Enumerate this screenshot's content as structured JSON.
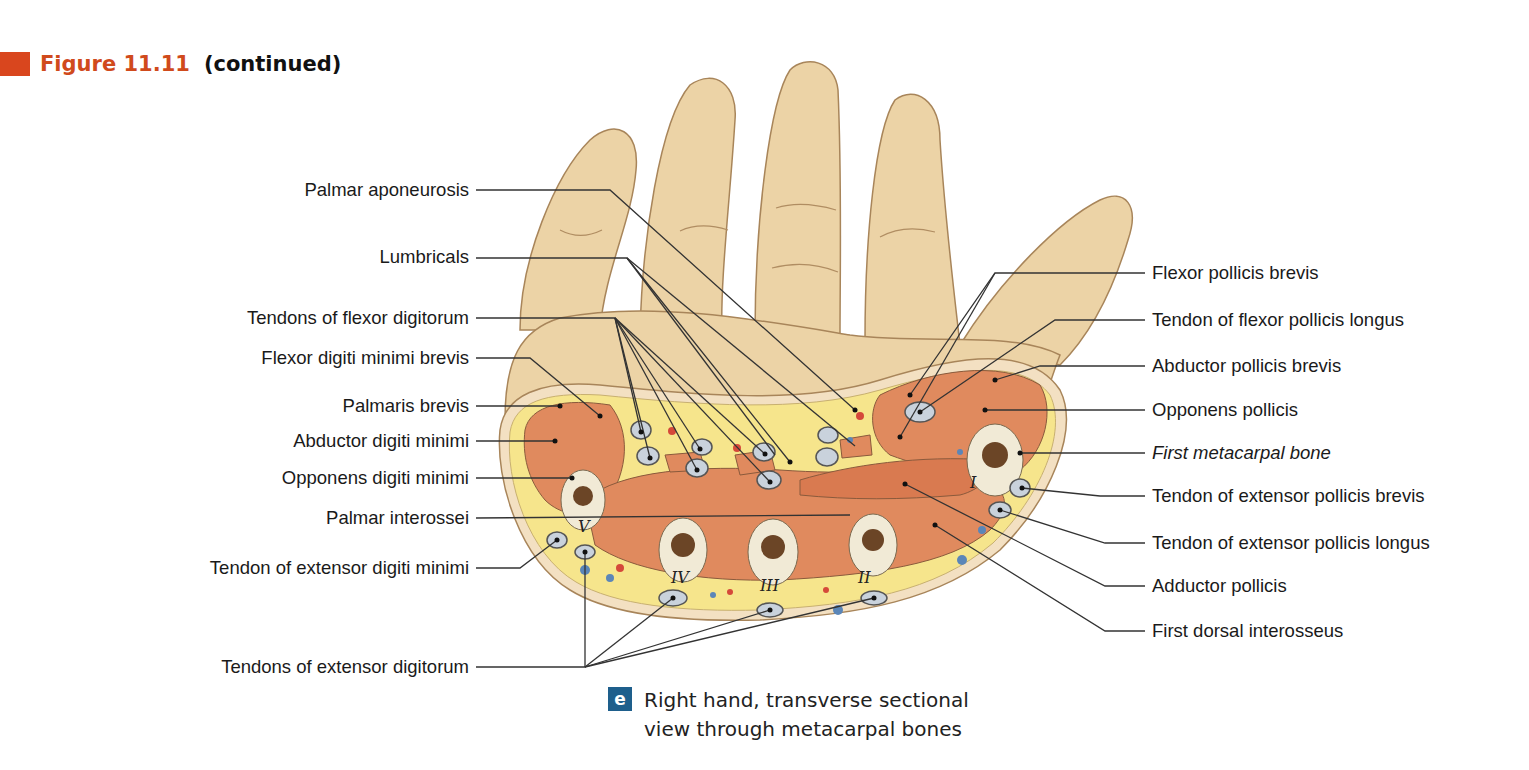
{
  "figure": {
    "number": "Figure 11.11",
    "continued": "(continued)",
    "accent_color": "#d9461e",
    "number_color": "#d04a1c"
  },
  "caption": {
    "badge": "e",
    "badge_color": "#1e5f8c",
    "line1": "Right hand, transverse sectional",
    "line2": "view through metacarpal bones"
  },
  "labels_left": [
    {
      "id": "palmar-aponeurosis",
      "text": "Palmar aponeurosis",
      "y": 190
    },
    {
      "id": "lumbricals",
      "text": "Lumbricals",
      "y": 257
    },
    {
      "id": "tendons-flexor-digitorum",
      "text": "Tendons of flexor digitorum",
      "y": 318
    },
    {
      "id": "flexor-digiti-minimi-brevis",
      "text": "Flexor digiti minimi brevis",
      "y": 358
    },
    {
      "id": "palmaris-brevis",
      "text": "Palmaris brevis",
      "y": 406
    },
    {
      "id": "abductor-digiti-minimi",
      "text": "Abductor digiti minimi",
      "y": 441
    },
    {
      "id": "opponens-digiti-minimi",
      "text": "Opponens digiti minimi",
      "y": 478
    },
    {
      "id": "palmar-interossei",
      "text": "Palmar interossei",
      "y": 518
    },
    {
      "id": "tendon-extensor-digiti-minimi",
      "text": "Tendon of extensor digiti minimi",
      "y": 568
    },
    {
      "id": "tendons-extensor-digitorum",
      "text": "Tendons of extensor digitorum",
      "y": 667
    }
  ],
  "labels_right": [
    {
      "id": "flexor-pollicis-brevis",
      "text": "Flexor pollicis brevis",
      "y": 273,
      "italic": false
    },
    {
      "id": "tendon-flexor-pollicis-longus",
      "text": "Tendon of flexor pollicis longus",
      "y": 320,
      "italic": false
    },
    {
      "id": "abductor-pollicis-brevis",
      "text": "Abductor pollicis brevis",
      "y": 366,
      "italic": false
    },
    {
      "id": "opponens-pollicis",
      "text": "Opponens pollicis",
      "y": 410,
      "italic": false
    },
    {
      "id": "first-metacarpal-bone",
      "text": "First metacarpal bone",
      "y": 453,
      "italic": true
    },
    {
      "id": "tendon-extensor-pollicis-brevis",
      "text": "Tendon of extensor pollicis brevis",
      "y": 496,
      "italic": false
    },
    {
      "id": "tendon-extensor-pollicis-longus",
      "text": "Tendon of extensor pollicis longus",
      "y": 543,
      "italic": false
    },
    {
      "id": "adductor-pollicis",
      "text": "Adductor pollicis",
      "y": 586,
      "italic": false
    },
    {
      "id": "first-dorsal-interosseus",
      "text": "First dorsal interosseus",
      "y": 631,
      "italic": false
    }
  ],
  "bone_numerals": [
    "I",
    "II",
    "III",
    "IV",
    "V"
  ],
  "colors": {
    "skin": "#ecd3a6",
    "skin_outline": "#a8855a",
    "fat": "#f6e58c",
    "muscle": "#e08a5e",
    "bone": "#f1ead6",
    "marrow": "#6b4526",
    "tendon": "#c9d2dc",
    "artery": "#d5493a",
    "vein": "#5b86b8",
    "leader": "#333333"
  }
}
